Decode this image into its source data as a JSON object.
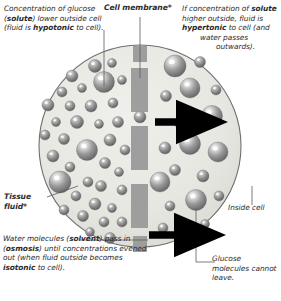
{
  "diagram": {
    "colors": {
      "cell_fill": "#e8e8e4",
      "cell_stroke": "#6f6f6f",
      "membrane": "#9a9a9a",
      "sphere_mid": "#8d8d8d",
      "sphere_dark": "#5c5c5c",
      "sphere_highlight": "#ffffff",
      "arrow": "#000000",
      "leader_line": "#5a5a5a",
      "text": "#2b2b2b",
      "background": "#ffffff"
    },
    "labels": {
      "top_left": {
        "line1": "Concentration of",
        "line2_a": "glucose (",
        "line2_b": "solute",
        "line2_c": ") lower",
        "line3": "outside cell (fluid is",
        "line4_a": "hypotonic",
        "line4_b": " to cell).",
        "full": "Concentration of glucose (solute) lower outside cell (fluid is hypotonic to cell)."
      },
      "top_right": {
        "line1": "If concentration of",
        "line2_a": "solute",
        "line2_b": " higher outside,",
        "line3_a": "fluid is ",
        "line3_b": "hypertonic",
        "line4": "to cell (and",
        "line5": "water passes",
        "line6": "outwards).",
        "full": "If concentration of solute higher outside, fluid is hypertonic to cell (and water passes outwards)."
      },
      "cell_membrane": "Cell membrane*",
      "tissue_fluid_line1": "Tissue",
      "tissue_fluid_line2": "fluid*",
      "inside_cell": "Inside cell",
      "bottom_left": {
        "line1": "Water molecules",
        "line2_a": "(",
        "line2_b": "solvent",
        "line2_c": ") pass in",
        "line3_a": "(",
        "line3_b": "osmosis",
        "line3_c": ") until concentrations",
        "line4": "evened out (when fluid outside",
        "line5_a": "becomes ",
        "line5_b": "isotonic",
        "line5_c": " to cell).",
        "full": "Water molecules (solvent) pass in (osmosis) until concentrations evened out (when fluid outside becomes isotonic to cell)."
      },
      "bottom_right": {
        "line1": "Glucose",
        "line2": "molecules",
        "line3": "cannot leave.",
        "full": "Glucose molecules cannot leave."
      }
    },
    "cell": {
      "cx": 140,
      "cy": 146,
      "r": 101
    },
    "membrane_segments": [
      {
        "x": 133,
        "y": 46,
        "w": 14,
        "h": 16
      },
      {
        "x": 131,
        "y": 68,
        "w": 17,
        "h": 44
      },
      {
        "x": 131,
        "y": 126,
        "w": 17,
        "h": 44
      },
      {
        "x": 131,
        "y": 184,
        "w": 17,
        "h": 44
      },
      {
        "x": 133,
        "y": 236,
        "w": 14,
        "h": 16
      }
    ],
    "arrows": [
      {
        "x": 155,
        "y": 122,
        "len": 32,
        "label": "water-flow-arrow-upper"
      },
      {
        "x": 149,
        "y": 235,
        "len": 36,
        "label": "water-flow-arrow-lower"
      }
    ],
    "spheres_left": [
      {
        "cx": 72,
        "cy": 76,
        "r": 6
      },
      {
        "cx": 95,
        "cy": 66,
        "r": 6.5
      },
      {
        "cx": 112,
        "cy": 63,
        "r": 4.5
      },
      {
        "cx": 62,
        "cy": 92,
        "r": 5
      },
      {
        "cx": 82,
        "cy": 88,
        "r": 4.5
      },
      {
        "cx": 104,
        "cy": 82,
        "r": 10.5
      },
      {
        "cx": 122,
        "cy": 80,
        "r": 4.5
      },
      {
        "cx": 48,
        "cy": 105,
        "r": 6
      },
      {
        "cx": 70,
        "cy": 106,
        "r": 5
      },
      {
        "cx": 91,
        "cy": 106,
        "r": 6
      },
      {
        "cx": 113,
        "cy": 103,
        "r": 5
      },
      {
        "cx": 56,
        "cy": 122,
        "r": 4.5
      },
      {
        "cx": 77,
        "cy": 122,
        "r": 6.5
      },
      {
        "cx": 99,
        "cy": 124,
        "r": 4.5
      },
      {
        "cx": 118,
        "cy": 122,
        "r": 5.5
      },
      {
        "cx": 45,
        "cy": 135,
        "r": 5
      },
      {
        "cx": 64,
        "cy": 139,
        "r": 5.5
      },
      {
        "cx": 87,
        "cy": 150,
        "r": 10.5
      },
      {
        "cx": 110,
        "cy": 140,
        "r": 6
      },
      {
        "cx": 125,
        "cy": 150,
        "r": 5
      },
      {
        "cx": 53,
        "cy": 156,
        "r": 6
      },
      {
        "cx": 70,
        "cy": 167,
        "r": 5
      },
      {
        "cx": 105,
        "cy": 163,
        "r": 5.5
      },
      {
        "cx": 119,
        "cy": 172,
        "r": 4.5
      },
      {
        "cx": 60,
        "cy": 182,
        "r": 11
      },
      {
        "cx": 88,
        "cy": 182,
        "r": 5
      },
      {
        "cx": 101,
        "cy": 186,
        "r": 5.5
      },
      {
        "cx": 122,
        "cy": 190,
        "r": 5
      },
      {
        "cx": 76,
        "cy": 196,
        "r": 5
      },
      {
        "cx": 95,
        "cy": 204,
        "r": 6
      },
      {
        "cx": 112,
        "cy": 208,
        "r": 4.5
      },
      {
        "cx": 64,
        "cy": 210,
        "r": 5
      },
      {
        "cx": 83,
        "cy": 216,
        "r": 5.5
      },
      {
        "cx": 104,
        "cy": 222,
        "r": 5
      },
      {
        "cx": 122,
        "cy": 222,
        "r": 5
      },
      {
        "cx": 90,
        "cy": 232,
        "r": 4.5
      },
      {
        "cx": 110,
        "cy": 238,
        "r": 5.5
      },
      {
        "cx": 140,
        "cy": 117,
        "r": 6
      }
    ],
    "spheres_right": [
      {
        "cx": 175,
        "cy": 66,
        "r": 11
      },
      {
        "cx": 200,
        "cy": 62,
        "r": 5.5
      },
      {
        "cx": 190,
        "cy": 88,
        "r": 10
      },
      {
        "cx": 216,
        "cy": 90,
        "r": 5
      },
      {
        "cx": 166,
        "cy": 96,
        "r": 5.5
      },
      {
        "cx": 212,
        "cy": 116,
        "r": 10.5
      },
      {
        "cx": 180,
        "cy": 124,
        "r": 5
      },
      {
        "cx": 190,
        "cy": 144,
        "r": 10.5
      },
      {
        "cx": 165,
        "cy": 148,
        "r": 6
      },
      {
        "cx": 218,
        "cy": 152,
        "r": 10
      },
      {
        "cx": 175,
        "cy": 170,
        "r": 5.5
      },
      {
        "cx": 203,
        "cy": 176,
        "r": 6
      },
      {
        "cx": 160,
        "cy": 182,
        "r": 10
      },
      {
        "cx": 196,
        "cy": 200,
        "r": 10.5
      },
      {
        "cx": 170,
        "cy": 206,
        "r": 5
      },
      {
        "cx": 219,
        "cy": 196,
        "r": 5
      },
      {
        "cx": 180,
        "cy": 228,
        "r": 5.5
      },
      {
        "cx": 205,
        "cy": 224,
        "r": 4.5
      },
      {
        "cx": 163,
        "cy": 228,
        "r": 5
      }
    ],
    "leader_lines": [
      {
        "name": "leader-top-left",
        "points": "104,30 104,48 104,86"
      },
      {
        "name": "leader-membrane",
        "points": "140,17 140,78"
      },
      {
        "name": "leader-tissue-fluid",
        "points": "47,197 78,186"
      },
      {
        "name": "leader-inside-cell",
        "points": "252,186 252,205"
      },
      {
        "name": "leader-water-molecules",
        "points": "80,240 148,240"
      },
      {
        "name": "leader-glucose",
        "points": "196,208 196,262 215,262"
      }
    ]
  }
}
